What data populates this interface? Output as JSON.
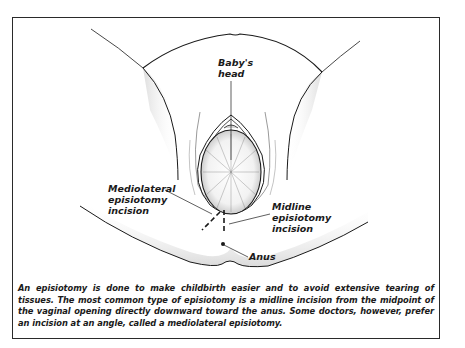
{
  "figure": {
    "labels": {
      "babys_head": [
        "Baby's",
        "head"
      ],
      "mediolateral": [
        "Mediolateral",
        "episiotomy",
        "incision"
      ],
      "midline": [
        "Midline",
        "episiotomy",
        "incision"
      ],
      "anus": [
        "Anus"
      ]
    },
    "caption": "An episiotomy is done to make childbirth easier and to avoid extensive tearing of tissues. The most common type of episiotomy is a midline incision from the midpoint of the vaginal opening directly downward toward the anus. Some doctors, however, prefer an incision at an angle, called a mediolateral episiotomy.",
    "colors": {
      "line": "#1a1a1a",
      "shade": "#c8c8c8",
      "background": "#ffffff"
    }
  }
}
